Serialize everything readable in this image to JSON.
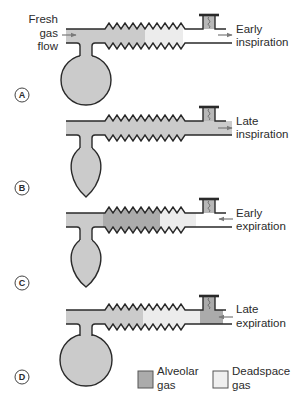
{
  "figure": {
    "fresh_gas_label": [
      "Fresh",
      "gas",
      "flow"
    ],
    "panels": [
      {
        "label": "A",
        "phase": [
          "Early",
          "inspiration"
        ],
        "flow_direction": "out",
        "reservoir_bag": "full",
        "tube_contents": [
          "fresh gas",
          "deadspace gas",
          "empty"
        ]
      },
      {
        "label": "B",
        "phase": [
          "Late",
          "inspiration"
        ],
        "flow_direction": "out",
        "reservoir_bag": "collapsed",
        "tube_contents": [
          "fresh gas"
        ]
      },
      {
        "label": "C",
        "phase": [
          "Early",
          "expiration"
        ],
        "flow_direction": "in",
        "reservoir_bag": "collapsed",
        "tube_contents": [
          "fresh gas",
          "alveolar gas",
          "deadspace gas",
          "empty"
        ]
      },
      {
        "label": "D",
        "phase": [
          "Late",
          "expiration"
        ],
        "flow_direction": "in",
        "reservoir_bag": "full",
        "tube_contents": [
          "fresh gas",
          "deadspace gas",
          "alveolar gas"
        ]
      }
    ],
    "legend": [
      {
        "label": [
          "Alveolar",
          "gas"
        ],
        "color": "#ababab"
      },
      {
        "label": [
          "Deadspace",
          "gas"
        ],
        "color": "#ececec"
      }
    ],
    "colors": {
      "fresh_gas": "#cbcbcb",
      "alveolar_gas": "#ababab",
      "deadspace_gas": "#ececec",
      "outline": "#2a2a2a",
      "arrow": "#7a7a7a"
    }
  }
}
